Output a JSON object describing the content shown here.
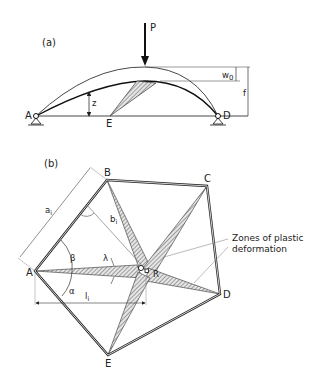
{
  "figure_a": {
    "label": "(a)",
    "load_label": "P",
    "points": {
      "A": "A",
      "D": "D",
      "E": "E"
    },
    "dims": {
      "rise_label": "z",
      "deflection_label": "w",
      "deflection_sub": "0",
      "height_label": "f"
    }
  },
  "figure_b": {
    "label": "(b)",
    "points": {
      "A": "A",
      "B": "B",
      "C": "C",
      "D": "D",
      "E": "E",
      "R": "R"
    },
    "dims": {
      "a_label": "a",
      "a_sub": "i",
      "b_label": "b",
      "b_sub": "i",
      "l_label": "l",
      "l_sub": "i",
      "alpha": "α",
      "beta": "β",
      "lambda": "λ"
    },
    "annotation": {
      "line1": "Zones of plastic",
      "line2": "deformation"
    }
  }
}
